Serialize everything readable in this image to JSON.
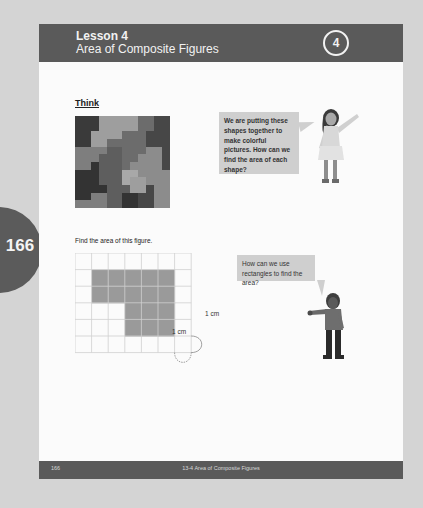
{
  "side_tab": {
    "page_number": "166"
  },
  "header": {
    "lesson_label": "Lesson 4",
    "lesson_title": "Area of Composite Figures",
    "lesson_badge": "4"
  },
  "think": {
    "heading": "Think",
    "speech_girl": "We are putting these shapes together to make colorful pictures. How can we find the area of each shape?"
  },
  "exercise": {
    "prompt": "Find the area of this figure.",
    "speech_boy": "How can we use rectangles to find the area?",
    "grid": {
      "columns": 7,
      "rows": 6,
      "shaded_cells": [
        [
          1,
          1
        ],
        [
          1,
          2
        ],
        [
          1,
          3
        ],
        [
          1,
          4
        ],
        [
          1,
          5
        ],
        [
          2,
          1
        ],
        [
          2,
          2
        ],
        [
          2,
          3
        ],
        [
          2,
          4
        ],
        [
          2,
          5
        ],
        [
          3,
          3
        ],
        [
          3,
          4
        ],
        [
          3,
          5
        ],
        [
          4,
          3
        ],
        [
          4,
          4
        ],
        [
          4,
          5
        ]
      ]
    },
    "unit_label_horizontal": "1 cm",
    "unit_label_vertical": "1 cm"
  },
  "footer": {
    "page_number": "166",
    "section_title": "13-4  Area of Composite Figures"
  },
  "colors": {
    "background": "#d4d4d4",
    "page": "#fbfbfb",
    "header_bar": "#5a5a5a",
    "bubble": "#cfcfcf",
    "shaded": "#9a9a9a",
    "grid_line": "#cfcfcf"
  }
}
